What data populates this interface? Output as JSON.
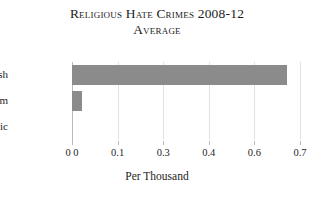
{
  "chart_data": {
    "type": "bar",
    "orientation": "horizontal",
    "title": "Religious Hate Crimes 2008-12 Average",
    "title_lines": [
      "Religious Hate Crimes 2008-12",
      "Average"
    ],
    "categories": [
      "Jewish",
      "Muslim",
      "Catholic"
    ],
    "values": [
      0.66,
      0.03,
      0.0
    ],
    "xlabel": "Per Thousand",
    "ylabel": "",
    "xlim": [
      0.0,
      0.7
    ],
    "xticks": [
      {
        "label": "0 0",
        "value": 0.0
      },
      {
        "label": "0.1",
        "value": 0.14
      },
      {
        "label": "0.3",
        "value": 0.28
      },
      {
        "label": "0.4",
        "value": 0.42
      },
      {
        "label": "0.6",
        "value": 0.56
      },
      {
        "label": "0.7",
        "value": 0.7
      }
    ],
    "grid": true,
    "grid_axis": "x",
    "legend": false,
    "bar_color": "#8b8b8b",
    "background_color": "#ffffff",
    "gridline_color": "#e2e2e2",
    "axis_color": "#b9b9b9"
  }
}
